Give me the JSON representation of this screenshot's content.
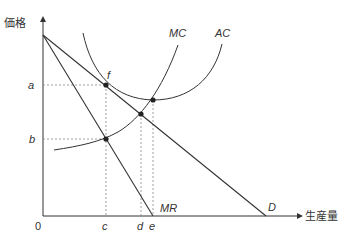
{
  "diagram": {
    "type": "monopoly-price-output",
    "axes": {
      "y_label": "価格",
      "x_label": "生産量",
      "origin_label": "0"
    },
    "curves": {
      "mc": "MC",
      "ac": "AC",
      "mr": "MR",
      "demand": "D"
    },
    "price_levels": {
      "a": "a",
      "b": "b"
    },
    "quantity_levels": {
      "c": "c",
      "d": "d",
      "e": "e"
    },
    "points": {
      "f": "f"
    },
    "colors": {
      "line": "#333333",
      "dotted": "#888888",
      "background": "#ffffff"
    }
  }
}
